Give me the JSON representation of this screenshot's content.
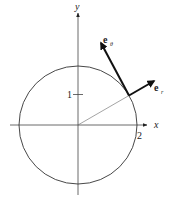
{
  "diagram": {
    "axes": {
      "x_label": "x",
      "y_label": "y"
    },
    "ticks": {
      "y_tick_label": "1",
      "x_tick_label": "2"
    },
    "circle": {
      "radius_units": 2
    },
    "vectors": {
      "e_r_base": "e",
      "e_r_sub": "r",
      "e_theta_base": "e",
      "e_theta_sub": "θ"
    },
    "colors": {
      "stroke": "#222222",
      "radius_line": "#555555",
      "background": "#ffffff"
    }
  }
}
